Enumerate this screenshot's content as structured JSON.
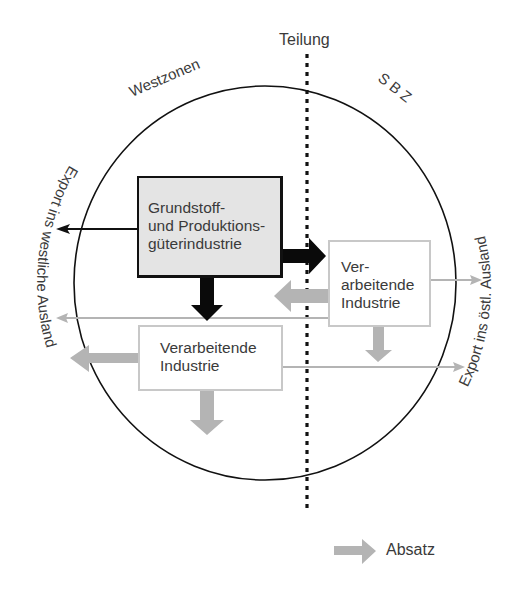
{
  "diagram": {
    "title_divider": "Teilung",
    "zones": {
      "west": "Westzonen",
      "east": "S B Z"
    },
    "boxes": {
      "primary_industry": {
        "lines": [
          "Grundstoff-",
          "und Produktions-",
          "güterindustrie"
        ],
        "fill": "#e4e4e4",
        "border": "#111111"
      },
      "processing_east": {
        "lines": [
          "Ver-",
          "arbeitende",
          "Industrie"
        ],
        "fill": "#ffffff",
        "border": "#c8c8c8"
      },
      "processing_west": {
        "lines": [
          "Verarbeitende",
          "Industrie"
        ],
        "fill": "#ffffff",
        "border": "#c8c8c8"
      }
    },
    "side_labels": {
      "left": "Export ins westliche  Ausland",
      "right": "Export ins östl. Ausland"
    },
    "legend": {
      "label": "Absatz",
      "arrow_color": "#b4b4b4"
    },
    "colors": {
      "circle": "#111111",
      "divider": "#111111",
      "primary_arrows": "#0a0a0a",
      "secondary_arrows": "#b4b4b4",
      "text": "#3a3a3a"
    },
    "flows": [
      {
        "from": "primary_industry",
        "to": "processing_east",
        "style": "bold-black"
      },
      {
        "from": "primary_industry",
        "to": "processing_west",
        "style": "bold-black"
      },
      {
        "from": "primary_industry",
        "to": "export_west",
        "style": "thin-black"
      },
      {
        "from": "processing_east",
        "to": "west_zone",
        "style": "bold-gray"
      },
      {
        "from": "processing_east",
        "to": "export_west",
        "style": "thin-gray"
      },
      {
        "from": "processing_east",
        "to": "export_east",
        "style": "thin-gray"
      },
      {
        "from": "processing_east",
        "to": "domestic_east",
        "style": "bold-gray"
      },
      {
        "from": "processing_west",
        "to": "export_west",
        "style": "bold-gray"
      },
      {
        "from": "processing_west",
        "to": "export_east",
        "style": "thin-gray"
      },
      {
        "from": "processing_west",
        "to": "domestic_west",
        "style": "bold-gray"
      }
    ]
  }
}
